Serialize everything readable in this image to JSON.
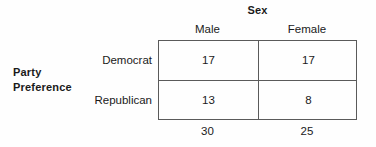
{
  "figure": {
    "column_group_label": "Sex",
    "row_group_label_line1": "Party",
    "row_group_label_line2": "Preference",
    "column_headers": [
      "Male",
      "Female"
    ],
    "row_headers": [
      "Democrat",
      "Republican"
    ],
    "cells": [
      [
        "17",
        "17"
      ],
      [
        "13",
        "8"
      ]
    ],
    "column_totals": [
      "30",
      "25"
    ],
    "border_color": "#5a5a5a",
    "text_color": "#1a1a1a",
    "background_color": "#fefefe"
  },
  "chart_data": {
    "type": "table",
    "row_variable": "Party Preference",
    "column_variable": "Sex",
    "categories": [
      "Male",
      "Female"
    ],
    "rows": [
      "Democrat",
      "Republican"
    ],
    "values": [
      [
        17,
        17
      ],
      [
        13,
        8
      ]
    ],
    "column_totals": [
      30,
      25
    ],
    "grand_total": 55
  }
}
